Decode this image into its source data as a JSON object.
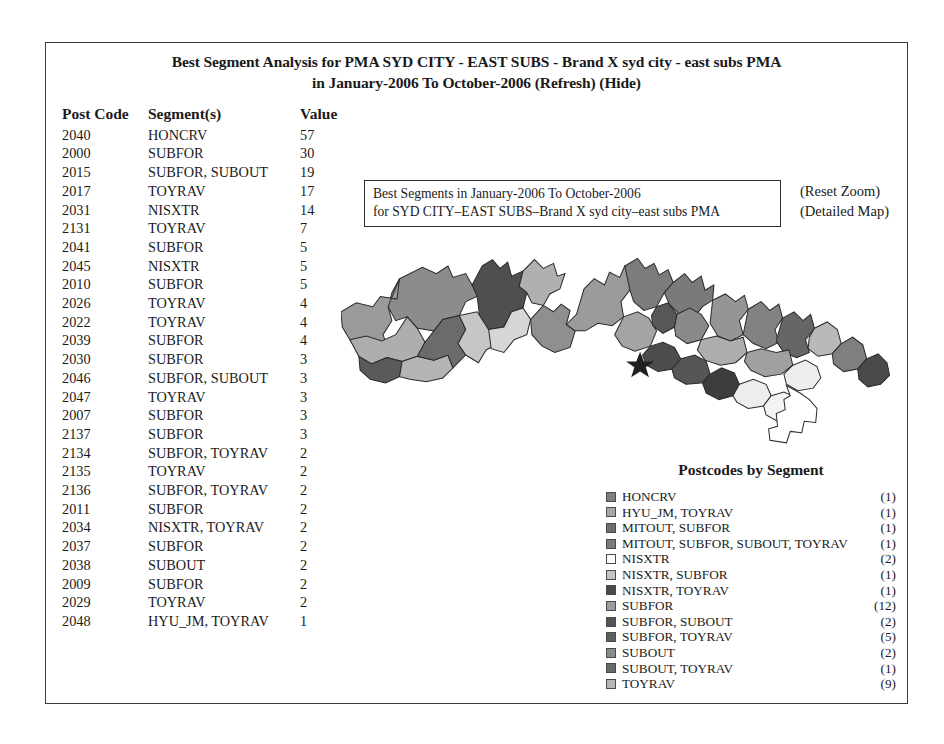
{
  "title": {
    "line1": "Best Segment Analysis for PMA SYD CITY - EAST SUBS - Brand X syd city - east subs PMA",
    "line2": "in January-2006 To October-2006 (Refresh) (Hide)"
  },
  "table": {
    "headers": [
      "Post Code",
      "Segment(s)",
      "Value"
    ],
    "rows": [
      [
        "2040",
        "HONCRV",
        "57"
      ],
      [
        "2000",
        "SUBFOR",
        "30"
      ],
      [
        "2015",
        "SUBFOR, SUBOUT",
        "19"
      ],
      [
        "2017",
        "TOYRAV",
        "17"
      ],
      [
        "2031",
        "NISXTR",
        "14"
      ],
      [
        "2131",
        "TOYRAV",
        "7"
      ],
      [
        "2041",
        "SUBFOR",
        "5"
      ],
      [
        "2045",
        "NISXTR",
        "5"
      ],
      [
        "2010",
        "SUBFOR",
        "5"
      ],
      [
        "2026",
        "TOYRAV",
        "4"
      ],
      [
        "2022",
        "TOYRAV",
        "4"
      ],
      [
        "2039",
        "SUBFOR",
        "4"
      ],
      [
        "2030",
        "SUBFOR",
        "3"
      ],
      [
        "2046",
        "SUBFOR, SUBOUT",
        "3"
      ],
      [
        "2047",
        "TOYRAV",
        "3"
      ],
      [
        "2007",
        "SUBFOR",
        "3"
      ],
      [
        "2137",
        "SUBFOR",
        "3"
      ],
      [
        "2134",
        "SUBFOR, TOYRAV",
        "2"
      ],
      [
        "2135",
        "TOYRAV",
        "2"
      ],
      [
        "2136",
        "SUBFOR, TOYRAV",
        "2"
      ],
      [
        "2011",
        "SUBFOR",
        "2"
      ],
      [
        "2034",
        "NISXTR, TOYRAV",
        "2"
      ],
      [
        "2037",
        "SUBFOR",
        "2"
      ],
      [
        "2038",
        "SUBOUT",
        "2"
      ],
      [
        "2009",
        "SUBFOR",
        "2"
      ],
      [
        "2029",
        "TOYRAV",
        "2"
      ],
      [
        "2048",
        "HYU_JM, TOYRAV",
        "1"
      ]
    ]
  },
  "zoom_control": {
    "link_label": "(Zoom)",
    "value": "14.90",
    "units": "kms"
  },
  "right_links": {
    "reset_zoom": "(Reset Zoom)",
    "detailed_map": "(Detailed Map)"
  },
  "map_caption": {
    "line1": "Best Segments in January-2006 To October-2006",
    "line2": "for SYD CITY–EAST SUBS–Brand X syd city–east subs PMA"
  },
  "legend": {
    "title": "Postcodes by Segment",
    "items": [
      {
        "label": "HONCRV",
        "count": "(1)",
        "color": "#808080"
      },
      {
        "label": "HYU_JM, TOYRAV",
        "count": "(1)",
        "color": "#a8a8a8"
      },
      {
        "label": "MITOUT, SUBFOR",
        "count": "(1)",
        "color": "#6e6e6e"
      },
      {
        "label": "MITOUT, SUBFOR, SUBOUT, TOYRAV",
        "count": "(1)",
        "color": "#7b7b7b"
      },
      {
        "label": "NISXTR",
        "count": "(2)",
        "color": "#ffffff"
      },
      {
        "label": "NISXTR, SUBFOR",
        "count": "(1)",
        "color": "#c4c4c4"
      },
      {
        "label": "NISXTR, TOYRAV",
        "count": "(1)",
        "color": "#4a4a4a"
      },
      {
        "label": "SUBFOR",
        "count": "(12)",
        "color": "#9c9c9c"
      },
      {
        "label": "SUBFOR, SUBOUT",
        "count": "(2)",
        "color": "#555555"
      },
      {
        "label": "SUBFOR, TOYRAV",
        "count": "(5)",
        "color": "#5e5e5e"
      },
      {
        "label": "SUBOUT",
        "count": "(2)",
        "color": "#8a8a8a"
      },
      {
        "label": "SUBOUT, TOYRAV",
        "count": "(1)",
        "color": "#6a6a6a"
      },
      {
        "label": "TOYRAV",
        "count": "(9)",
        "color": "#b5b5b5"
      }
    ]
  },
  "map": {
    "marker": "star-marker",
    "regions": [
      {
        "id": "r01",
        "color": "#8c8c8c",
        "d": "M92,60 L128,42 L150,52 L168,40 L176,58 L196,52 L206,70 L218,62 L214,88 L196,96 L186,118 L160,124 L146,142 L120,138 L104,120 L86,126 L74,104 L80,82 Z"
      },
      {
        "id": "r02",
        "color": "#4f4f4f",
        "d": "M206,70 L222,40 L238,30 L250,44 L262,34 L268,56 L286,48 L280,72 L292,82 L286,106 L268,112 L256,136 L232,140 L218,120 L214,88 Z"
      },
      {
        "id": "r03",
        "color": "#b0b0b0",
        "d": "M286,48 L304,30 L318,44 L334,36 L340,56 L352,52 L344,76 L328,84 L318,102 L300,98 L292,82 L280,72 Z"
      },
      {
        "id": "r04",
        "color": "#9a9a9a",
        "d": "M0,112 L24,98 L50,104 L62,88 L88,92 L92,60 L74,104 L80,126 L66,148 L74,170 L56,184 L30,176 L14,156 L2,136 Z"
      },
      {
        "id": "r05",
        "color": "#aeaeae",
        "d": "M14,156 L40,150 L64,158 L86,148 L104,120 L120,138 L132,160 L120,182 L96,190 L72,184 L48,194 L28,182 Z"
      },
      {
        "id": "r06",
        "color": "#5a5a5a",
        "d": "M28,182 L48,194 L72,184 L96,190 L92,214 L70,224 L46,218 L30,204 Z"
      },
      {
        "id": "r07",
        "color": "#b4b4b4",
        "d": "M96,190 L120,182 L146,188 L168,180 L176,200 L160,216 L134,222 L108,218 L92,214 Z"
      },
      {
        "id": "r08",
        "color": "#6b6b6b",
        "d": "M132,160 L160,124 L186,118 L196,140 L184,162 L196,180 L176,200 L168,180 L146,188 L120,182 Z"
      },
      {
        "id": "r09",
        "color": "#c6c6c6",
        "d": "M186,118 L214,112 L232,140 L256,136 L250,160 L228,172 L216,192 L196,180 L184,162 L196,140 Z"
      },
      {
        "id": "r10",
        "color": "#d6d6d6",
        "d": "M232,140 L256,136 L268,112 L286,106 L298,124 L292,148 L272,156 L256,176 L236,170 Z"
      },
      {
        "id": "r11",
        "color": "#8f8f8f",
        "d": "M298,124 L318,102 L334,112 L346,100 L360,110 L354,132 L368,142 L360,168 L336,176 L316,166 L300,148 Z"
      },
      {
        "id": "r12",
        "color": "#9b9b9b",
        "d": "M354,132 L370,116 L382,76 L398,60 L414,70 L422,50 L438,58 L446,40 L460,52 L454,78 L440,96 L444,120 L426,134 L404,130 L384,142 L368,142 Z"
      },
      {
        "id": "r13",
        "color": "#7c7c7c",
        "d": "M446,40 L466,28 L478,44 L492,36 L500,54 L514,46 L522,66 L508,82 L496,104 L476,110 L460,96 L454,78 Z"
      },
      {
        "id": "r14",
        "color": "#7a7a7a",
        "d": "M522,66 L540,52 L552,66 L566,56 L572,78 L586,70 L584,94 L568,104 L554,122 L534,118 L516,100 L508,82 Z"
      },
      {
        "id": "r15",
        "color": "#a4a4a4",
        "d": "M444,120 L466,112 L484,122 L496,142 L486,166 L462,174 L442,166 L430,148 Z"
      },
      {
        "id": "r16",
        "color": "#585858",
        "d": "M496,104 L514,98 L528,116 L524,136 L506,146 L490,134 L488,118 Z"
      },
      {
        "id": "r17",
        "color": "#8a8a8a",
        "d": "M528,116 L548,106 L566,116 L578,134 L566,156 L544,162 L526,150 L524,136 Z"
      },
      {
        "id": "r18",
        "color": "#959595",
        "d": "M584,94 L604,84 L620,96 L634,86 L640,108 L626,126 L632,148 L612,158 L592,150 L580,130 Z"
      },
      {
        "id": "r19",
        "color": "#828282",
        "d": "M640,108 L660,96 L674,110 L688,100 L694,122 L682,140 L688,160 L668,170 L648,162 L632,148 Z"
      },
      {
        "id": "r20",
        "color": "#666666",
        "d": "M694,122 L712,112 L726,126 L738,116 L744,138 L730,156 L736,176 L716,184 L696,176 L684,158 Z"
      },
      {
        "id": "r21",
        "color": "#adadad",
        "d": "M566,156 L590,150 L612,158 L632,152 L638,176 L620,192 L596,196 L572,188 L560,172 Z"
      },
      {
        "id": "r22",
        "color": "#a0a0a0",
        "d": "M638,176 L660,170 L684,176 L704,172 L710,196 L692,210 L666,214 L644,204 L634,190 Z"
      },
      {
        "id": "r23",
        "color": "#4c4c4c",
        "d": "M486,166 L506,160 L524,168 L534,186 L522,202 L498,206 L480,196 L474,180 Z"
      },
      {
        "id": "r24",
        "color": "#565656",
        "d": "M534,186 L556,180 L574,190 L580,210 L566,224 L542,226 L524,216 L520,202 Z"
      },
      {
        "id": "r25",
        "color": "#3d3d3d",
        "d": "M580,210 L598,200 L618,208 L626,226 L616,244 L594,250 L574,240 L568,224 Z"
      },
      {
        "id": "r26",
        "color": "#ededed",
        "d": "M626,226 L648,218 L668,226 L676,244 L664,260 L640,264 L622,254 L616,244 Z"
      },
      {
        "id": "r27",
        "color": "#eeeeee",
        "d": "M710,196 L730,188 L748,198 L754,216 L742,232 L718,236 L700,226 L696,210 Z"
      },
      {
        "id": "r28",
        "color": "#f3f3f3",
        "d": "M676,244 L696,238 L714,246 L722,264 L710,280 L686,284 L668,274 L664,260 Z"
      },
      {
        "id": "r29",
        "color": "#b9b9b9",
        "d": "M744,138 L764,128 L780,140 L786,162 L772,178 L750,182 L734,170 L736,152 Z"
      },
      {
        "id": "r30",
        "color": "#7f7f7f",
        "d": "M786,162 L804,152 L820,164 L826,186 L812,202 L790,206 L774,194 L772,178 Z"
      },
      {
        "id": "r31",
        "color": "#4a4a4a",
        "d": "M826,186 L844,178 L858,192 L862,212 L848,226 L828,230 L814,218 L812,202 Z"
      }
    ],
    "outline_paths": [
      "M700,228 L706,244 L696,250 L698,266 L684,272 L686,292 L672,296 L674,314 L700,318 L706,300 L724,302 L728,284 L746,286 L748,264 L736,250 L722,240 Z"
    ]
  }
}
